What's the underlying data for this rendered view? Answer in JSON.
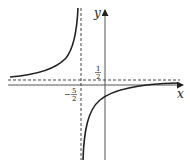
{
  "figure": {
    "axes": {
      "x_label": "x",
      "y_label": "y"
    },
    "asymptotes": {
      "vertical": {
        "label_sign": "−",
        "label_num": "5",
        "label_den": "2",
        "value": "-5/2"
      },
      "horizontal": {
        "label_num": "1",
        "label_den": "2",
        "value": "1/2"
      }
    },
    "colors": {
      "curve": "#222222",
      "axis": "#555555",
      "dashed": "#444444"
    }
  }
}
